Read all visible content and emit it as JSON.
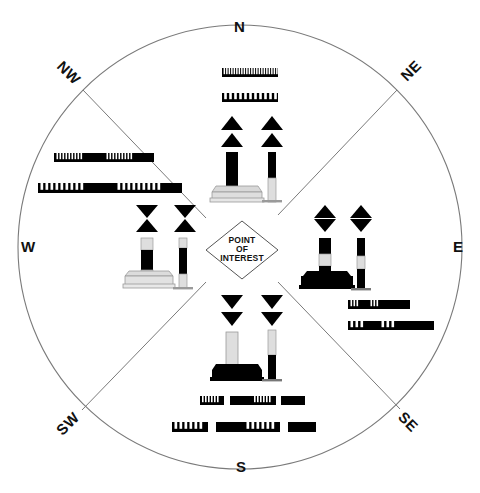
{
  "diagram": {
    "center_label_lines": [
      "POINT",
      "OF",
      "INTEREST"
    ],
    "compass": {
      "cardinal": [
        {
          "id": "north",
          "label": "N",
          "x": 240,
          "y": 27,
          "rotation": 0
        },
        {
          "id": "east",
          "label": "E",
          "x": 459,
          "y": 246,
          "rotation": 0
        },
        {
          "id": "south",
          "label": "S",
          "x": 241,
          "y": 467,
          "rotation": 0
        },
        {
          "id": "west",
          "label": "W",
          "x": 27,
          "y": 246,
          "rotation": 0
        }
      ],
      "intercardinal": [
        {
          "id": "northeast",
          "label": "NE",
          "x": 410,
          "y": 72,
          "rotation": -45
        },
        {
          "id": "southeast",
          "label": "SE",
          "x": 409,
          "y": 422,
          "rotation": 45
        },
        {
          "id": "southwest",
          "label": "SW",
          "x": 67,
          "y": 424,
          "rotation": -45
        },
        {
          "id": "northwest",
          "label": "NW",
          "x": 68,
          "y": 74,
          "rotation": 45
        }
      ]
    },
    "circle": {
      "cx": 240,
      "cy": 247,
      "r": 222,
      "stroke": "#7a7a7a",
      "stroke_width": 1.1,
      "fill": "none"
    },
    "diagonals": {
      "stroke": "#7a7a7a",
      "stroke_width": 1.0
    },
    "center_diamond": {
      "cx": 242,
      "cy": 250,
      "half_width": 36,
      "half_height": 29,
      "stroke": "#555555",
      "fill": "#ffffff"
    },
    "colors": {
      "black": "#000000",
      "white": "#ffffff",
      "buoy_light": "#e2e2e2",
      "buoy_mid": "#d0d0d0",
      "line": "#7a7a7a",
      "text": "#111111"
    },
    "quadrants": [
      {
        "id": "north",
        "name": "North Cardinal Mark",
        "topmarks": "two-cones-point-up",
        "body_color_description": "black over yellow",
        "light_rhythm_primary": "VQ continuous very quick flashing",
        "light_rhythm_secondary": "Q continuous quick flashing",
        "primary_flash_count": 22,
        "secondary_flash_count": 11
      },
      {
        "id": "east",
        "name": "East Cardinal Mark",
        "topmarks": "two-cones-base-to-base",
        "body_color_description": "black with single broad horizontal yellow band",
        "light_rhythm_primary": "VQ(3) every 5 seconds",
        "light_rhythm_secondary": "Q(3) every 10 seconds",
        "primary_flash_count": 3,
        "secondary_flash_count": 3
      },
      {
        "id": "south",
        "name": "South Cardinal Mark",
        "topmarks": "two-cones-point-down",
        "body_color_description": "yellow over black",
        "light_rhythm_primary": "VQ(6) + Long Flash every 10 seconds",
        "light_rhythm_secondary": "Q(6) + Long Flash every 15 seconds",
        "primary_flash_count": 6,
        "secondary_flash_count": 6
      },
      {
        "id": "west",
        "name": "West Cardinal Mark",
        "topmarks": "two-cones-point-to-point",
        "body_color_description": "yellow with single broad horizontal black band",
        "light_rhythm_primary": "VQ(9) every 10 seconds",
        "light_rhythm_secondary": "Q(9) every 15 seconds",
        "primary_flash_count": 9,
        "secondary_flash_count": 9
      }
    ]
  }
}
